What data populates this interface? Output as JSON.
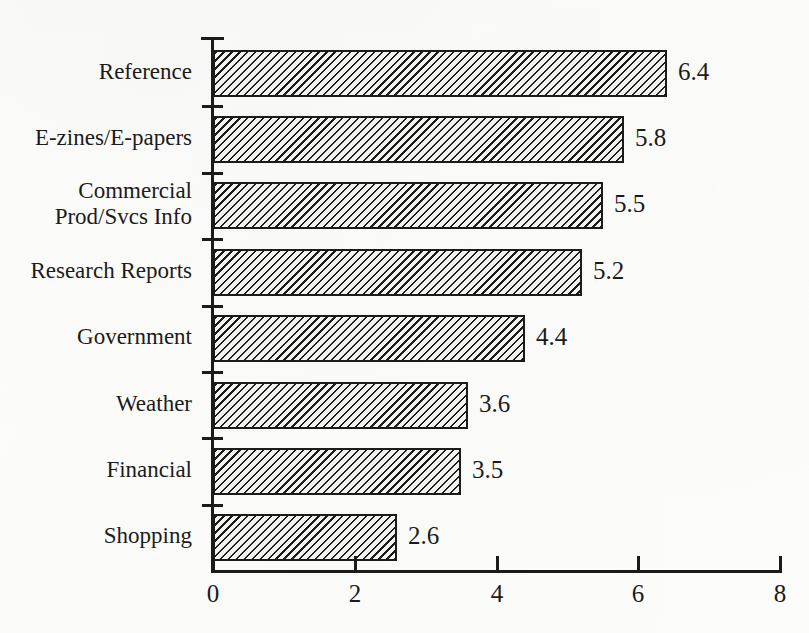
{
  "figure": {
    "background_color": "#fdfdfc",
    "ink_color": "#1b1b1b",
    "title_remnant": ""
  },
  "chart_data": {
    "type": "bar",
    "orientation": "horizontal",
    "title": "",
    "subtitle": "",
    "xlabel": "",
    "ylabel": "",
    "xlim": [
      0,
      8
    ],
    "ylim": null,
    "grid": false,
    "legend": null,
    "legend_position": "none",
    "bar_style": {
      "fill": "diagonal-hatch",
      "hatch": "\\\\",
      "edge_color": "#1b1b1b",
      "face_color": "#f2f2f0"
    },
    "x_ticks": [
      0,
      2,
      4,
      6,
      8
    ],
    "x_tick_labels": [
      "0",
      "2",
      "4",
      "6",
      "8"
    ],
    "categories": [
      "Reference",
      "E-zines/E-papers",
      "Commercial\nProd/Svcs Info",
      "Research Reports",
      "Government",
      "Weather",
      "Financial",
      "Shopping"
    ],
    "values": [
      6.4,
      5.8,
      5.5,
      5.2,
      4.4,
      3.6,
      3.5,
      2.6
    ],
    "data_labels": [
      "6.4",
      "5.8",
      "5.5",
      "5.2",
      "4.4",
      "3.6",
      "3.5",
      "2.6"
    ],
    "annotations": []
  }
}
